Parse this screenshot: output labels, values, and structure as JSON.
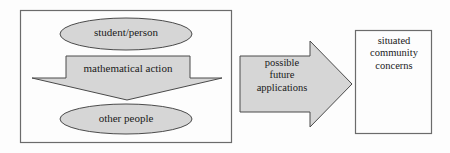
{
  "diagram": {
    "background_color": "#fdfdfd",
    "shape_fill_color": "#d6d6d6",
    "shape_stroke_color": "#4a4a4a",
    "box_stroke_color": "#6b6b6b",
    "text_color": "#1a1a1a",
    "container": {
      "name": "left-grouping-box"
    },
    "nodes": {
      "student_person": {
        "label": "student/person",
        "shape": "ellipse"
      },
      "mathematical_action": {
        "label": "mathematical action",
        "shape": "down-block-arrow"
      },
      "other_people": {
        "label": "other people",
        "shape": "ellipse"
      },
      "possible_future_applications": {
        "shape": "right-block-arrow",
        "lines": [
          "possible",
          "future",
          "applications"
        ]
      },
      "situated_community_concerns": {
        "shape": "rectangle",
        "lines": [
          "situated",
          "community",
          "concerns"
        ]
      }
    }
  }
}
